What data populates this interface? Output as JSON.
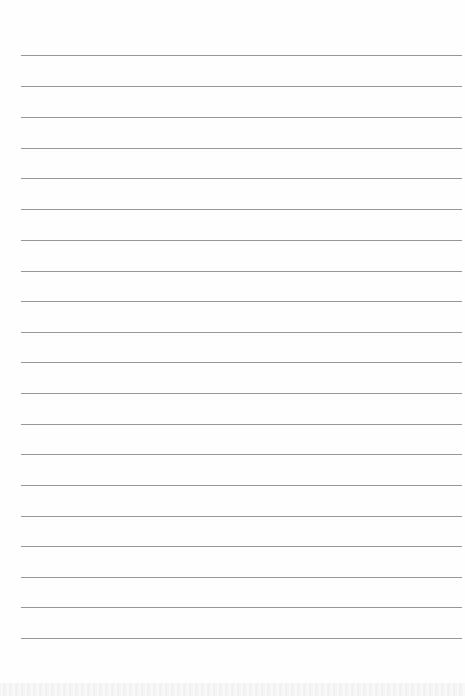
{
  "document": {
    "type": "lined-paper",
    "background_color": "#fefefe",
    "rule_color": "#8c8c8c",
    "rule_count": 20,
    "rules_y": [
      55,
      86,
      117,
      148,
      178,
      209,
      240,
      271,
      301,
      332,
      362,
      393,
      424,
      454,
      485,
      516,
      546,
      577,
      607,
      638
    ],
    "rule_left": 21,
    "rule_right": 462
  }
}
